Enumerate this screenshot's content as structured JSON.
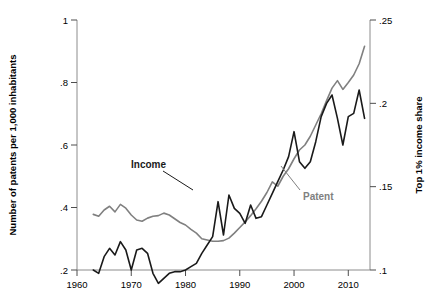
{
  "chart_data": {
    "type": "line",
    "title": "",
    "xlabel": "",
    "ylabel": "Number of patents per 1,000 inhabitants",
    "ylabel_right": "Top 1% income share",
    "xlim": [
      1960,
      2014
    ],
    "ylim": [
      0.2,
      1.0
    ],
    "ylim_right": [
      0.1,
      0.25
    ],
    "xticks": [
      "1960",
      "1970",
      "1980",
      "1990",
      "2000",
      "2010"
    ],
    "xtick_values": [
      1960,
      1970,
      1980,
      1990,
      2000,
      2010
    ],
    "yticks": [
      ".2",
      ".4",
      ".6",
      ".8",
      "1"
    ],
    "ytick_values": [
      0.2,
      0.4,
      0.6,
      0.8,
      1.0
    ],
    "yticks_right": [
      ".1",
      ".15",
      ".2",
      ".25"
    ],
    "ytick_right_values": [
      0.1,
      0.15,
      0.2,
      0.25
    ],
    "grid": false,
    "legend_position": "inline-annotation",
    "series": [
      {
        "name": "Patent",
        "axis": "left",
        "color": "#808080",
        "label_text": "Patent",
        "x": [
          1963,
          1964,
          1965,
          1966,
          1967,
          1968,
          1969,
          1970,
          1971,
          1972,
          1973,
          1974,
          1975,
          1976,
          1977,
          1978,
          1979,
          1980,
          1981,
          1982,
          1983,
          1984,
          1985,
          1986,
          1987,
          1988,
          1989,
          1990,
          1991,
          1992,
          1993,
          1994,
          1995,
          1996,
          1997,
          1998,
          1999,
          2000,
          2001,
          2002,
          2003,
          2004,
          2005,
          2006,
          2007,
          2008,
          2009,
          2010,
          2011,
          2012,
          2013
        ],
        "values": [
          0.378,
          0.372,
          0.392,
          0.404,
          0.386,
          0.41,
          0.398,
          0.376,
          0.36,
          0.356,
          0.366,
          0.372,
          0.374,
          0.382,
          0.376,
          0.364,
          0.352,
          0.344,
          0.33,
          0.318,
          0.3,
          0.296,
          0.292,
          0.292,
          0.294,
          0.302,
          0.318,
          0.336,
          0.354,
          0.374,
          0.396,
          0.42,
          0.448,
          0.482,
          0.468,
          0.5,
          0.524,
          0.556,
          0.584,
          0.6,
          0.628,
          0.664,
          0.7,
          0.742,
          0.782,
          0.806,
          0.778,
          0.8,
          0.824,
          0.86,
          0.916
        ]
      },
      {
        "name": "Income",
        "axis": "right",
        "color": "#1a1a1a",
        "label_text": "Income",
        "x": [
          1963,
          1964,
          1965,
          1966,
          1967,
          1968,
          1969,
          1970,
          1971,
          1972,
          1973,
          1974,
          1975,
          1976,
          1977,
          1978,
          1979,
          1980,
          1981,
          1982,
          1983,
          1984,
          1985,
          1986,
          1987,
          1988,
          1989,
          1990,
          1991,
          1992,
          1993,
          1994,
          1995,
          1996,
          1997,
          1998,
          1999,
          2000,
          2001,
          2002,
          2003,
          2004,
          2005,
          2006,
          2007,
          2008,
          2009,
          2010,
          2011,
          2012,
          2013
        ],
        "values": [
          0.1,
          0.098,
          0.108,
          0.113,
          0.109,
          0.117,
          0.112,
          0.1,
          0.112,
          0.113,
          0.11,
          0.098,
          0.092,
          0.095,
          0.098,
          0.099,
          0.099,
          0.1,
          0.102,
          0.104,
          0.11,
          0.115,
          0.12,
          0.141,
          0.121,
          0.145,
          0.137,
          0.134,
          0.128,
          0.139,
          0.131,
          0.132,
          0.139,
          0.146,
          0.153,
          0.16,
          0.168,
          0.183,
          0.165,
          0.161,
          0.165,
          0.177,
          0.192,
          0.2,
          0.205,
          0.191,
          0.175,
          0.192,
          0.194,
          0.208,
          0.191
        ]
      }
    ],
    "annotations": [
      {
        "text": "Income",
        "series": "Income",
        "x_px": 131,
        "y_px": 165
      },
      {
        "text": "Patent",
        "series": "Patent",
        "x_px": 303,
        "y_px": 196
      }
    ]
  }
}
